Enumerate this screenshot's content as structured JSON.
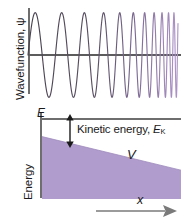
{
  "figure": {
    "panels": {
      "top": {
        "y_axis_label": "Wavefunction, ψ",
        "baseline_label": ""
      },
      "bottom": {
        "y_axis_label": "Energy",
        "total_energy_label": "E",
        "potential_label": "V",
        "kinetic_energy_label": "Kinetic energy, ",
        "kinetic_energy_subscript": "K",
        "kinetic_energy_symbol": "E",
        "x_axis_label": "x"
      }
    }
  },
  "colors": {
    "potential_fill": "#b09dcd",
    "wave_left": "#4a4452",
    "wave_right": "#a98fc4",
    "axis": "#6e6e6e",
    "text": "#1a1a1a",
    "background": "#ffffff"
  },
  "chart_data": {
    "type": "line",
    "panels": [
      {
        "name": "wavefunction",
        "type": "line",
        "ylabel": "Wavefunction, ψ",
        "xlabel": "",
        "grid": false,
        "legend": null,
        "description": "Oscillating wavefunction whose wavelength shortens (frequency increases) from left to right as the kinetic energy grows; amplitude stays roughly constant while line colour shifts from dark grey to purple.",
        "x_range": [
          0,
          1
        ],
        "y_range": [
          -1,
          1
        ],
        "series": [
          {
            "name": "psi",
            "wavelength_start": 0.195,
            "wavelength_end": 0.028,
            "amplitude": 0.92,
            "cycles_visible": 13
          }
        ]
      },
      {
        "name": "energy",
        "type": "area",
        "ylabel": "Energy",
        "xlabel": "x",
        "grid": false,
        "legend": null,
        "x_range": [
          0,
          1
        ],
        "y_range": [
          0,
          1
        ],
        "series": [
          {
            "name": "E",
            "label": "E",
            "type": "horizontal-line",
            "value": 1.0
          },
          {
            "name": "V",
            "label": "V",
            "type": "area",
            "x": [
              0,
              1
            ],
            "values": [
              0.78,
              0.36
            ]
          },
          {
            "name": "Kinetic energy, E_K",
            "label": "Kinetic energy, Eₖ",
            "type": "annotation-arrow",
            "x": 0.16,
            "y_from": 0.78,
            "y_to": 1.0
          }
        ]
      }
    ]
  }
}
